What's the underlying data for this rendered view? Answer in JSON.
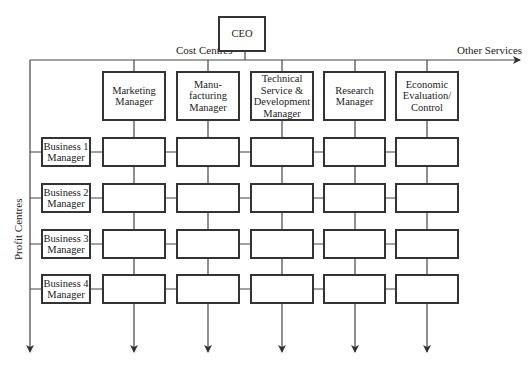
{
  "ceo": {
    "label": "CEO"
  },
  "axis_labels": {
    "cost_centres": "Cost Centres",
    "other_services": "Other Services",
    "profit_centres": "Profit Centres"
  },
  "columns": [
    {
      "label": "Marketing\nManager"
    },
    {
      "label": "Manu-\nfacturing\nManager"
    },
    {
      "label": "Technical\nService &\nDevelopment\nManager"
    },
    {
      "label": "Research\nManager"
    },
    {
      "label": "Economic\nEvaluation/\nControl"
    }
  ],
  "rows": [
    {
      "label": "Business 1\nManager"
    },
    {
      "label": "Business 2\nManager"
    },
    {
      "label": "Business 3\nManager"
    },
    {
      "label": "Business 4\nManager"
    }
  ],
  "colors": {
    "line": "#333333",
    "background": "#ffffff"
  }
}
